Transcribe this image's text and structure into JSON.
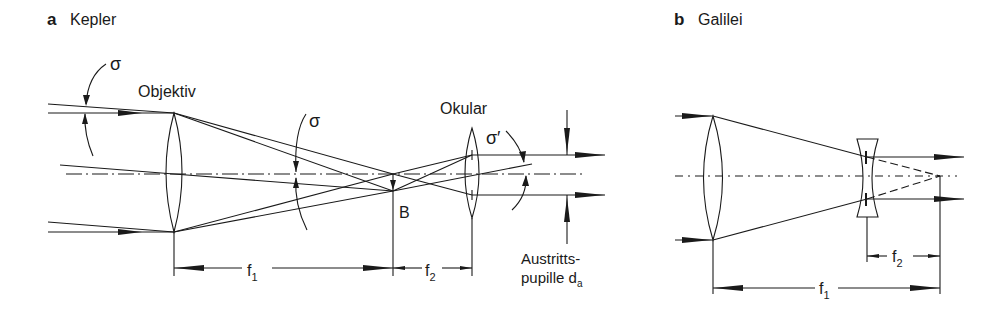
{
  "panels": {
    "a": {
      "letter": "a",
      "title": "Kepler",
      "labels": {
        "objective": "Objektiv",
        "eyepiece": "Okular",
        "sigma_in": "σ",
        "sigma_mid": "σ",
        "sigma_out": "σ′",
        "image_point": "B",
        "f1": "f",
        "f1_sub": "1",
        "f2": "f",
        "f2_sub": "2",
        "exit_pupil_line1": "Austritts-",
        "exit_pupil_line2": "pupille d",
        "exit_pupil_sub": "a"
      }
    },
    "b": {
      "letter": "b",
      "title": "Galilei",
      "labels": {
        "f1": "f",
        "f1_sub": "1",
        "f2": "f",
        "f2_sub": "2"
      }
    }
  },
  "colors": {
    "ink": "#1a1a1a",
    "background": "#ffffff"
  }
}
